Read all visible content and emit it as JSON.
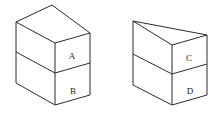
{
  "figure": {
    "background_color": "#ffffff",
    "line_color": "#2b2b2b",
    "label_color": "#1a1a1a",
    "width": 224,
    "height": 123,
    "shapes": [
      {
        "id": "left-solid",
        "name": "rectangular-prism-stack",
        "description": "Upright rectangular box divided into an upper block and a lower block",
        "labels": [
          {
            "text": "A",
            "part": "upper-block",
            "x": 72,
            "y": 56
          },
          {
            "text": "B",
            "part": "lower-block",
            "x": 73,
            "y": 91
          }
        ],
        "geometry": {
          "top_back_left": [
            16,
            22
          ],
          "top_apex": [
            52,
            5
          ],
          "top_back_right": [
            90,
            33
          ],
          "top_front": [
            55,
            43
          ],
          "divider_left": [
            16,
            52
          ],
          "divider_front": [
            55,
            73
          ],
          "divider_right": [
            90,
            63
          ],
          "bottom_left": [
            16,
            83
          ],
          "bottom_front": [
            55,
            105
          ],
          "bottom_right": [
            90,
            95
          ]
        }
      },
      {
        "id": "right-solid",
        "name": "wedge-prism-stack",
        "description": "Box with a slanted triangular wedge top divided into an upper block and a lower block",
        "labels": [
          {
            "text": "C",
            "part": "upper-block",
            "x": 189,
            "y": 58
          },
          {
            "text": "D",
            "part": "lower-block",
            "x": 190,
            "y": 91
          }
        ],
        "geometry": {
          "wedge_apex": [
            133,
            21
          ],
          "wedge_back_right": [
            207,
            35
          ],
          "wedge_front": [
            172,
            45
          ],
          "divider_left": [
            133,
            54
          ],
          "divider_front": [
            172,
            74
          ],
          "divider_right": [
            207,
            64
          ],
          "bottom_left": [
            133,
            85
          ],
          "bottom_front": [
            172,
            105
          ],
          "bottom_right": [
            207,
            95
          ]
        }
      }
    ]
  }
}
